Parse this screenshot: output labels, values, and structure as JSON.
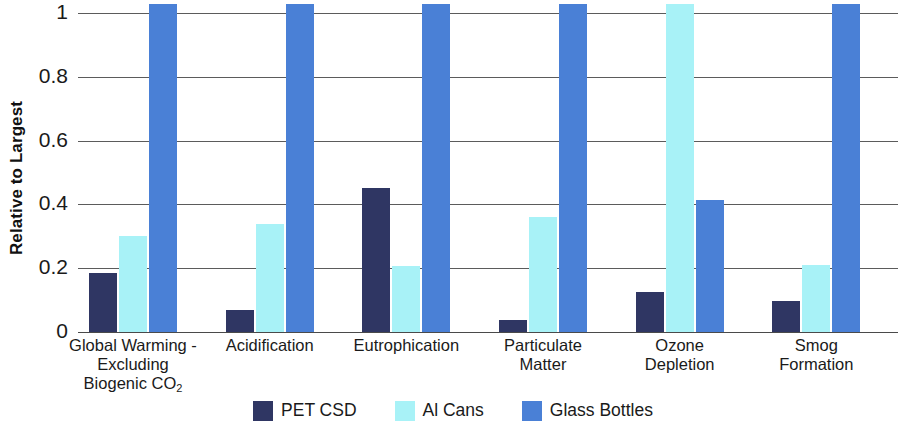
{
  "chart_data": {
    "type": "bar",
    "title": "",
    "xlabel": "",
    "ylabel": "Relative to Largest",
    "ylim": [
      0,
      1
    ],
    "yticks": [
      "0",
      "0.2",
      "0.4",
      "0.6",
      "0.8",
      "1"
    ],
    "grid": true,
    "legend_position": "bottom",
    "categories": [
      "Global Warming - Excluding Biogenic CO2",
      "Acidification",
      "Eutrophication",
      "Particulate Matter",
      "Ozone Depletion",
      "Smog Formation"
    ],
    "category_lines": [
      [
        "Global Warming -",
        "Excluding",
        "Biogenic CO",
        "2"
      ],
      [
        "Acidification"
      ],
      [
        "Eutrophication"
      ],
      [
        "Particulate",
        "Matter"
      ],
      [
        "Ozone",
        "Depletion"
      ],
      [
        "Smog",
        "Formation"
      ]
    ],
    "series": [
      {
        "name": "PET CSD",
        "color": "#2f3663",
        "values": [
          0.185,
          0.07,
          0.45,
          0.037,
          0.127,
          0.096
        ]
      },
      {
        "name": "Al Cans",
        "color": "#a8f2f7",
        "values": [
          0.3,
          0.34,
          0.207,
          0.36,
          1.0,
          0.21
        ]
      },
      {
        "name": "Glass Bottles",
        "color": "#4a80d6",
        "values": [
          1.0,
          1.0,
          1.0,
          1.0,
          0.415,
          1.0
        ]
      }
    ]
  },
  "legend": {
    "items": [
      {
        "label": "PET CSD",
        "color": "#2f3663"
      },
      {
        "label": "Al Cans",
        "color": "#a8f2f7"
      },
      {
        "label": "Glass Bottles",
        "color": "#4a80d6"
      }
    ]
  }
}
